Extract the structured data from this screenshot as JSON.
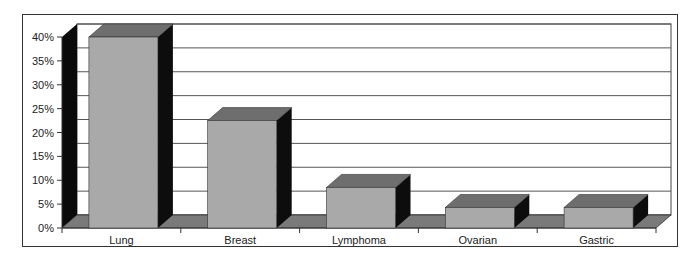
{
  "chart_data": {
    "type": "bar",
    "style": "3d-column",
    "title": "",
    "xlabel": "",
    "ylabel": "",
    "categories": [
      "Lung",
      "Breast",
      "Lymphoma",
      "Ovarian",
      "Gastric"
    ],
    "values": [
      40,
      22.5,
      8.5,
      4.3,
      4.3
    ],
    "unit": "%",
    "ylim": [
      0,
      40
    ],
    "yticks": [
      "0%",
      "5%",
      "10%",
      "15%",
      "20%",
      "25%",
      "30%",
      "35%",
      "40%"
    ],
    "grid": true,
    "legend": null,
    "colors": {
      "bar_front": "#a9a9a9",
      "bar_top": "#6e6e6e",
      "bar_side": "#0d0d0d",
      "floor": "#7a7a7a",
      "left_wall": "#0a0a0a",
      "back_wall": "#ffffff",
      "gridline": "#555555"
    }
  }
}
